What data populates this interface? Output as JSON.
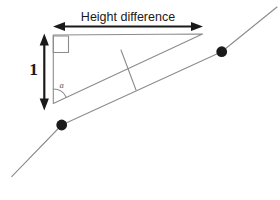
{
  "diagram": {
    "labels": {
      "height_difference": "Height difference",
      "unit_rise": "1",
      "angle": "a"
    },
    "colors": {
      "background": "#ffffff",
      "ink": "#1a1a1a",
      "line": "#8c8c8c",
      "angle_label": "#555555"
    },
    "main_line": {
      "points": "11.7,176.7 61.7,125 221.7,51.7 277,7"
    },
    "points": [
      {
        "x": 61.7,
        "y": 125,
        "r": 5.4
      },
      {
        "x": 221.7,
        "y": 51.7,
        "r": 5.4
      }
    ],
    "triangle": {
      "points": "53.3,35 202.5,34 53.3,103.5",
      "right_angle_box": {
        "x": 53.3,
        "y": 36,
        "w": 15.2,
        "h": 16.5
      },
      "angle_arc_path": "M 53.3,89 A 14.5,14.5 0 0 1 66.4,97.4",
      "tick": {
        "x1": 121,
        "y1": 50,
        "x2": 136,
        "y2": 90
      }
    },
    "arrows": {
      "horizontal": {
        "y": 26.5,
        "x1": 53,
        "x2": 203
      },
      "vertical": {
        "x": 44.3,
        "y1": 33.5,
        "y2": 110.5
      }
    }
  }
}
